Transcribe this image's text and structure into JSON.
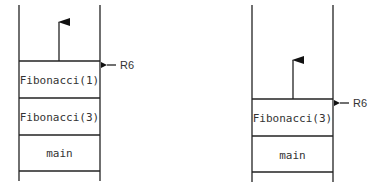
{
  "diagram": {
    "type": "call-stack",
    "stacks": [
      {
        "name": "left",
        "frames": [
          {
            "label": "Fibonacci(1)"
          },
          {
            "label": "Fibonacci(3)"
          },
          {
            "label": "main"
          }
        ],
        "pointer": {
          "label": "R6",
          "points_to": "Fibonacci(1)"
        }
      },
      {
        "name": "right",
        "frames": [
          {
            "label": "Fibonacci(3)"
          },
          {
            "label": "main"
          }
        ],
        "pointer": {
          "label": "R6",
          "points_to": "Fibonacci(3)"
        }
      }
    ]
  }
}
